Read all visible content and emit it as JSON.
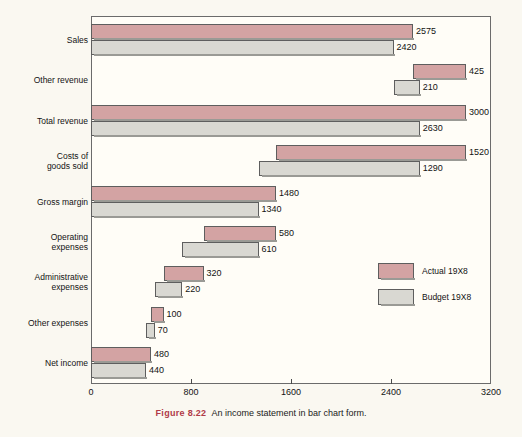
{
  "figure": {
    "number_label": "Figure  8.22",
    "caption": "An income statement in bar chart form.",
    "number_color": "#b03a48"
  },
  "legend": {
    "position": "middle-right",
    "items": [
      {
        "label": "Actual 19X8",
        "color": "#d3a3a3",
        "key": "actual"
      },
      {
        "label": "Budget 19X8",
        "color": "#d9d8d2",
        "key": "budget"
      }
    ]
  },
  "axis": {
    "ticks": [
      "0",
      "800",
      "1600",
      "2400",
      "3200"
    ],
    "tick_values": [
      0,
      800,
      1600,
      2400,
      3200
    ],
    "min": 0,
    "max": 3200
  },
  "chart_data": {
    "type": "bar",
    "subtype": "waterfall-floating-bar",
    "title": "An income statement in bar chart form.",
    "xlabel": "",
    "ylabel": "",
    "xlim": [
      0,
      3200
    ],
    "grid": false,
    "legend_position": "middle-right",
    "orientation": "horizontal",
    "categories": [
      "Sales",
      "Other revenue",
      "Total revenue",
      "Costs of\ngoods sold",
      "Gross margin",
      "Operating\nexpenses",
      "Administrative\nexpenses",
      "Other expenses",
      "Net income"
    ],
    "series": [
      {
        "name": "Actual 19X8",
        "color": "#d3a3a3",
        "values": [
          2575,
          425,
          3000,
          1520,
          1480,
          580,
          320,
          100,
          480
        ],
        "labels": [
          "2575",
          "425",
          "3000",
          "1520",
          "1480",
          "580",
          "320",
          "100",
          "480"
        ],
        "spans": [
          {
            "start": 0,
            "end": 2575
          },
          {
            "start": 2575,
            "end": 3000
          },
          {
            "start": 0,
            "end": 3000
          },
          {
            "start": 1480,
            "end": 3000
          },
          {
            "start": 0,
            "end": 1480
          },
          {
            "start": 900,
            "end": 1480
          },
          {
            "start": 580,
            "end": 900
          },
          {
            "start": 480,
            "end": 580
          },
          {
            "start": 0,
            "end": 480
          }
        ]
      },
      {
        "name": "Budget 19X8",
        "color": "#d9d8d2",
        "values": [
          2420,
          210,
          2630,
          1290,
          1340,
          610,
          220,
          70,
          440
        ],
        "labels": [
          "2420",
          "210",
          "2630",
          "1290",
          "1340",
          "610",
          "220",
          "70",
          "440"
        ],
        "spans": [
          {
            "start": 0,
            "end": 2420
          },
          {
            "start": 2420,
            "end": 2630
          },
          {
            "start": 0,
            "end": 2630
          },
          {
            "start": 1340,
            "end": 2630
          },
          {
            "start": 0,
            "end": 1340
          },
          {
            "start": 730,
            "end": 1340
          },
          {
            "start": 510,
            "end": 730
          },
          {
            "start": 440,
            "end": 510
          },
          {
            "start": 0,
            "end": 440
          }
        ]
      }
    ]
  }
}
